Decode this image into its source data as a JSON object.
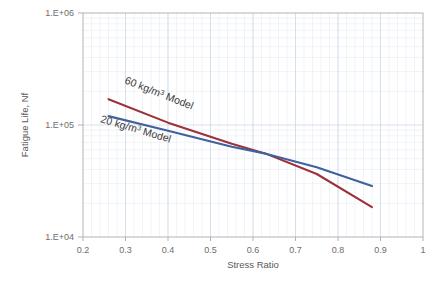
{
  "chart_data": {
    "type": "line",
    "title": "",
    "xlabel": "Stress Ratio",
    "ylabel": "Fatigue Life, Nf",
    "xlim": [
      0.2,
      1.0
    ],
    "ylim": [
      10000,
      1000000
    ],
    "yscale": "log",
    "xscale": "linear",
    "grid": true,
    "minor_grid": true,
    "legend_position": "inline-annotations",
    "xticks": [
      "0.2",
      "0.3",
      "0.4",
      "0.5",
      "0.6",
      "0.7",
      "0.8",
      "0.9",
      "1"
    ],
    "xtick_values": [
      0.2,
      0.3,
      0.4,
      0.5,
      0.6,
      0.7,
      0.8,
      0.9,
      1.0
    ],
    "yticks": [
      "1.E+04",
      "1.E+05",
      "1.E+06"
    ],
    "ytick_values": [
      10000,
      100000,
      1000000
    ],
    "series": [
      {
        "name": "60 kg/m3 Model",
        "label_text": "60 kg/m",
        "label_sup": "3",
        "label_suffix": " Model",
        "color": "#9C3139",
        "x": [
          0.26,
          0.4,
          0.55,
          0.63,
          0.75,
          0.88
        ],
        "values": [
          170000,
          105000,
          68000,
          55500,
          36500,
          18500
        ]
      },
      {
        "name": "20 kg/m3 Model",
        "label_text": "20 kg/m",
        "label_sup": "3",
        "label_suffix": " Model",
        "color": "#40619E",
        "x": [
          0.26,
          0.4,
          0.55,
          0.63,
          0.75,
          0.88
        ],
        "values": [
          120000,
          89000,
          64000,
          55500,
          42000,
          28500
        ]
      }
    ]
  },
  "axes": {
    "x_title": "Stress Ratio",
    "y_title": "Fatigue Life, Nf",
    "x_ticks": [
      "0.2",
      "0.3",
      "0.4",
      "0.5",
      "0.6",
      "0.7",
      "0.8",
      "0.9",
      "1"
    ],
    "y_ticks": [
      "1.E+06",
      "1.E+05",
      "1.E+04"
    ]
  },
  "annotations": {
    "series_60": {
      "prefix": "60 kg/m",
      "sup": "3",
      "suffix": " Model"
    },
    "series_20": {
      "prefix": "20 kg/m",
      "sup": "3",
      "suffix": " Model"
    }
  },
  "colors": {
    "red_series": "#9C3139",
    "blue_series": "#40619E",
    "major_grid": "#cfd9e8",
    "minor_grid": "#e9eef5",
    "frame": "#b3b3b3",
    "tick_text": "#6d6d6d",
    "background": "#ffffff"
  }
}
